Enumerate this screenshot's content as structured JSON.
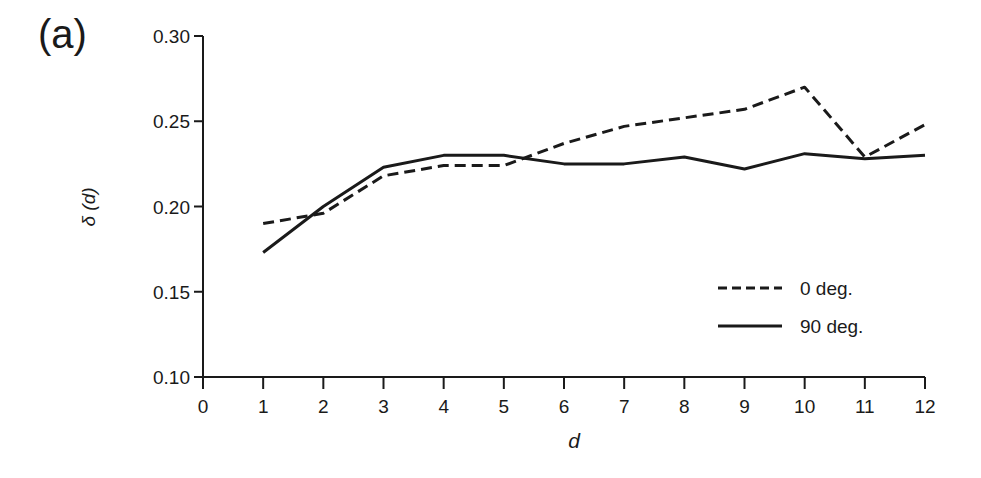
{
  "panel_label": "(a)",
  "chart_data": {
    "type": "line",
    "title": "",
    "xlabel": "d",
    "ylabel": "δ (d)",
    "xlim": [
      0,
      12
    ],
    "ylim": [
      0.1,
      0.3
    ],
    "x_ticks": [
      0,
      1,
      2,
      3,
      4,
      5,
      6,
      7,
      8,
      9,
      10,
      11,
      12
    ],
    "y_ticks": [
      "0.10",
      "0.15",
      "0.20",
      "0.25",
      "0.30"
    ],
    "grid": false,
    "legend_position": "lower right",
    "x": [
      1,
      2,
      3,
      4,
      5,
      6,
      7,
      8,
      9,
      10,
      11,
      12
    ],
    "series": [
      {
        "name": "0 deg.",
        "style": "dashed",
        "values": [
          0.19,
          0.196,
          0.218,
          0.224,
          0.224,
          0.237,
          0.247,
          0.252,
          0.257,
          0.27,
          0.229,
          0.248
        ]
      },
      {
        "name": "90 deg.",
        "style": "solid",
        "values": [
          0.173,
          0.2,
          0.223,
          0.23,
          0.23,
          0.225,
          0.225,
          0.229,
          0.222,
          0.231,
          0.228,
          0.23
        ]
      }
    ]
  },
  "colors": {
    "line": "#1a1a1a",
    "background": "#ffffff"
  }
}
